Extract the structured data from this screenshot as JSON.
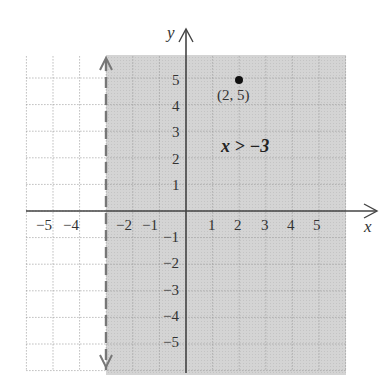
{
  "chart_data": {
    "type": "region",
    "title": "",
    "inequality": "x > −3",
    "boundary": {
      "x": -3,
      "style": "dashed",
      "included": false
    },
    "shaded_region": "x > -3",
    "xlabel": "x",
    "ylabel": "y",
    "xlim": [
      -6,
      6
    ],
    "ylim": [
      -6,
      6
    ],
    "grid": true,
    "x_ticks": [
      -5,
      -4,
      -2,
      -1,
      1,
      2,
      3,
      4,
      5
    ],
    "y_ticks": [
      5,
      4,
      3,
      2,
      1,
      -1,
      -2,
      -3,
      -4,
      -5
    ],
    "points": [
      {
        "x": 2,
        "y": 5,
        "label": "(2, 5)"
      }
    ]
  },
  "labels": {
    "x_axis": "x",
    "y_axis": "y",
    "inequality": "x > −3",
    "point": "(2, 5)",
    "x_ticks": [
      "−5",
      "−4",
      "−2",
      "−1",
      "1",
      "2",
      "3",
      "4",
      "5"
    ],
    "y_ticks": [
      "5",
      "4",
      "3",
      "2",
      "1",
      "−1",
      "−2",
      "−3",
      "−4",
      "−5"
    ]
  }
}
